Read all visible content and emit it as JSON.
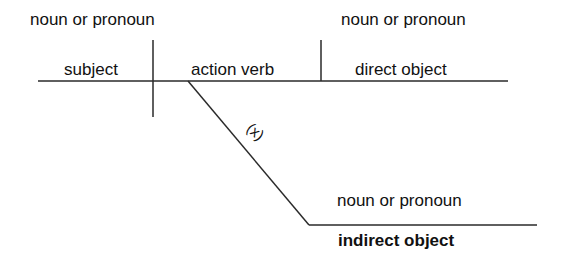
{
  "diagram": {
    "title": "",
    "labels": {
      "subject_hint": "noun or pronoun",
      "direct_object_hint": "noun or pronoun",
      "indirect_object_hint": "noun or pronoun",
      "subject": "subject",
      "verb": "action verb",
      "direct_object": "direct object",
      "indirect_object": "indirect object",
      "implied_marker": "(x)"
    },
    "colors": {
      "line": "#2a2a2a",
      "text": "#111111",
      "background": "#ffffff"
    }
  }
}
